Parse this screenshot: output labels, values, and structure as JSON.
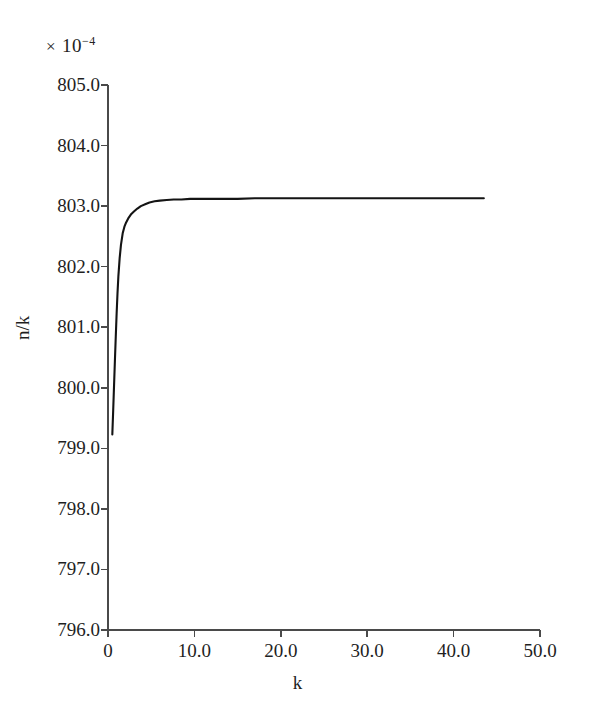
{
  "figure": {
    "multiplier_times": "×",
    "multiplier_base": "10",
    "multiplier_exponent": "−4",
    "multiplier_full": "× 10⁻⁴"
  },
  "chart_data": {
    "type": "line",
    "title": "",
    "subtitle": "",
    "xlabel": "k",
    "ylabel": "n/k",
    "y_multiplier": "× 10⁻⁴",
    "xlim": [
      0,
      50
    ],
    "ylim": [
      796.0,
      805.0
    ],
    "grid": false,
    "legend": null,
    "legend_position": "none",
    "xticks": [
      0,
      10,
      20,
      30,
      40,
      50
    ],
    "xtick_labels": [
      "0",
      "10.0",
      "20.0",
      "30.0",
      "40.0",
      "50.0"
    ],
    "yticks": [
      796.0,
      797.0,
      798.0,
      799.0,
      800.0,
      801.0,
      802.0,
      803.0,
      804.0,
      805.0
    ],
    "ytick_labels": [
      "796.0",
      "797.0",
      "798.0",
      "799.0",
      "800.0",
      "801.0",
      "802.0",
      "803.0",
      "804.0",
      "805.0"
    ],
    "series": [
      {
        "name": "n/k",
        "color": "#141414",
        "line_width": 2.1,
        "x": [
          0.5,
          0.6,
          0.7,
          0.8,
          0.9,
          1.0,
          1.1,
          1.2,
          1.35,
          1.5,
          1.7,
          1.9,
          2.1,
          2.4,
          2.7,
          3.0,
          3.4,
          3.8,
          4.3,
          4.8,
          5.4,
          6.0,
          6.8,
          7.6,
          8.5,
          9.5,
          10.5,
          12.0,
          13.5,
          15.0,
          17.0,
          19.0,
          21.0,
          23.5,
          26.0,
          29.0,
          32.0,
          35.0,
          38.0,
          41.0,
          43.5
        ],
        "y": [
          799.23,
          799.62,
          800.04,
          800.45,
          800.85,
          801.23,
          801.56,
          801.84,
          802.14,
          802.36,
          802.55,
          802.66,
          802.73,
          802.81,
          802.87,
          802.91,
          802.96,
          803.0,
          803.03,
          803.06,
          803.08,
          803.09,
          803.1,
          803.11,
          803.11,
          803.12,
          803.12,
          803.12,
          803.12,
          803.12,
          803.13,
          803.13,
          803.13,
          803.13,
          803.13,
          803.13,
          803.13,
          803.13,
          803.13,
          803.13,
          803.13
        ],
        "start_value": 799.23,
        "plateau_value": 803.13,
        "x_start": 0.5,
        "x_end": 43.5
      }
    ],
    "annotations": []
  }
}
